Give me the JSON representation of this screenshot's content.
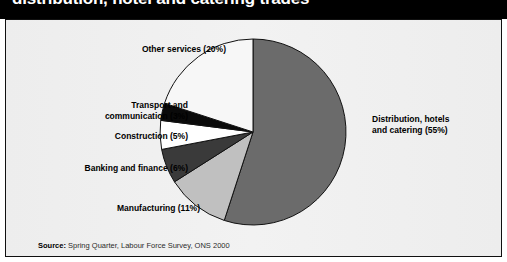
{
  "title": "distribution, hotel and catering trades",
  "source": {
    "key": "Source:",
    "text": "Spring Quarter, Labour Force Survey, ONS 2000"
  },
  "labels": {
    "other_services": "Other services (20%)",
    "transport": "Transport and\ncommunication (3%)",
    "construction": "Construction (5%)",
    "banking": "Banking and finance (6%)",
    "manufacturing": "Manufacturing (11%)",
    "distribution": "Distribution, hotels\nand catering (55%)"
  },
  "chart_data": {
    "type": "pie",
    "title": "distribution, hotel and catering trades",
    "xlabel": "",
    "ylabel": "",
    "start_angle_deg": 0,
    "direction": "clockwise",
    "legend": "none",
    "grid": false,
    "categories": [
      "Distribution, hotels and catering",
      "Manufacturing",
      "Banking and finance",
      "Construction",
      "Transport and communication",
      "Other services"
    ],
    "values": [
      55,
      11,
      6,
      5,
      3,
      20
    ],
    "value_unit": "%",
    "colors": [
      "#6b6b6b",
      "#c0c0c0",
      "#3a3a3a",
      "#ffffff",
      "#0a0a0a",
      "#f7f7f7"
    ],
    "slice_outline": "#111111",
    "annotations": [
      "Distribution, hotels and catering (55%)",
      "Manufacturing (11%)",
      "Banking and finance (6%)",
      "Construction (5%)",
      "Transport and communication (3%)",
      "Other services (20%)"
    ]
  },
  "geometry": {
    "center_x": 253,
    "center_y": 132,
    "radius": 93
  },
  "colors": {
    "title_bar": "#000000",
    "title_text": "#ffffff",
    "panel_bg": "#efefef",
    "panel_border": "#101010"
  }
}
